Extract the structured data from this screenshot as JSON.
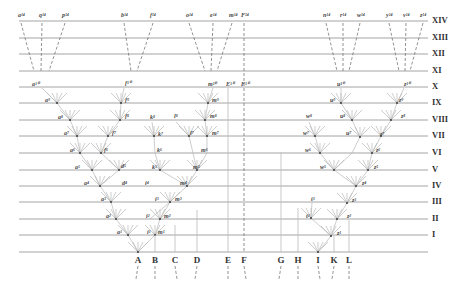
{
  "diagram": {
    "title": "",
    "levels": [
      {
        "label": "XIV",
        "y": 21
      },
      {
        "label": "XIII",
        "y": 38
      },
      {
        "label": "XII",
        "y": 54
      },
      {
        "label": "XI",
        "y": 71
      },
      {
        "label": "X",
        "y": 87
      },
      {
        "label": "IX",
        "y": 103
      },
      {
        "label": "VIII",
        "y": 120
      },
      {
        "label": "VII",
        "y": 136
      },
      {
        "label": "VI",
        "y": 153
      },
      {
        "label": "V",
        "y": 170
      },
      {
        "label": "IV",
        "y": 186
      },
      {
        "label": "III",
        "y": 202
      },
      {
        "label": "II",
        "y": 219
      },
      {
        "label": "I",
        "y": 235
      }
    ],
    "base_y": 252,
    "species": [
      {
        "label": "A",
        "x": 138
      },
      {
        "label": "B",
        "x": 155
      },
      {
        "label": "C",
        "x": 175
      },
      {
        "label": "D",
        "x": 197
      },
      {
        "label": "E",
        "x": 228
      },
      {
        "label": "F",
        "x": 244
      },
      {
        "label": "G",
        "x": 281
      },
      {
        "label": "H",
        "x": 298
      },
      {
        "label": "I",
        "x": 318
      },
      {
        "label": "K",
        "x": 334
      },
      {
        "label": "L",
        "x": 349
      }
    ],
    "top_descendants": [
      {
        "label": "a¹⁴",
        "x": 21
      },
      {
        "label": "q¹⁴",
        "x": 42
      },
      {
        "label": "p¹⁴",
        "x": 65
      },
      {
        "label": "b¹⁴",
        "x": 124
      },
      {
        "label": "f¹⁴",
        "x": 153
      },
      {
        "label": "o¹⁴",
        "x": 189
      },
      {
        "label": "e¹⁴",
        "x": 213
      },
      {
        "label": "m¹⁴",
        "x": 232
      },
      {
        "label": "F¹⁴",
        "x": 244
      },
      {
        "label": "n¹⁴",
        "x": 326
      },
      {
        "label": "r¹⁴",
        "x": 343
      },
      {
        "label": "w¹⁴",
        "x": 360
      },
      {
        "label": "y¹⁴",
        "x": 389
      },
      {
        "label": "v¹⁴",
        "x": 406
      },
      {
        "label": "z¹⁴",
        "x": 423
      }
    ],
    "node_labels": [
      {
        "label": "a¹⁰",
        "x": 32,
        "y": 80
      },
      {
        "label": "a⁹",
        "x": 45,
        "y": 97
      },
      {
        "label": "a⁸",
        "x": 58,
        "y": 114
      },
      {
        "label": "a⁷",
        "x": 64,
        "y": 130
      },
      {
        "label": "a⁶",
        "x": 70,
        "y": 147
      },
      {
        "label": "a⁵",
        "x": 75,
        "y": 164
      },
      {
        "label": "a⁴",
        "x": 84,
        "y": 180
      },
      {
        "label": "a³",
        "x": 101,
        "y": 196
      },
      {
        "label": "a²",
        "x": 106,
        "y": 213
      },
      {
        "label": "a¹",
        "x": 117,
        "y": 229
      },
      {
        "label": "f¹⁰",
        "x": 125,
        "y": 79
      },
      {
        "label": "f⁹",
        "x": 125,
        "y": 97
      },
      {
        "label": "f⁸",
        "x": 125,
        "y": 113
      },
      {
        "label": "f⁷",
        "x": 112,
        "y": 130
      },
      {
        "label": "f⁶",
        "x": 104,
        "y": 147
      },
      {
        "label": "d⁵",
        "x": 121,
        "y": 163
      },
      {
        "label": "d⁴",
        "x": 122,
        "y": 180
      },
      {
        "label": "m¹⁰",
        "x": 208,
        "y": 80
      },
      {
        "label": "m⁹",
        "x": 212,
        "y": 97
      },
      {
        "label": "m⁸",
        "x": 210,
        "y": 113
      },
      {
        "label": "m⁷",
        "x": 212,
        "y": 130
      },
      {
        "label": "m⁶",
        "x": 201,
        "y": 147
      },
      {
        "label": "m⁵",
        "x": 193,
        "y": 164
      },
      {
        "label": "m⁴",
        "x": 180,
        "y": 180
      },
      {
        "label": "m³",
        "x": 175,
        "y": 196
      },
      {
        "label": "m²",
        "x": 164,
        "y": 213
      },
      {
        "label": "m¹",
        "x": 158,
        "y": 229
      },
      {
        "label": "k⁸",
        "x": 150,
        "y": 114
      },
      {
        "label": "k⁷",
        "x": 158,
        "y": 131
      },
      {
        "label": "k⁶",
        "x": 157,
        "y": 147
      },
      {
        "label": "k⁵",
        "x": 152,
        "y": 164
      },
      {
        "label": "l⁸",
        "x": 174,
        "y": 113
      },
      {
        "label": "l⁷",
        "x": 190,
        "y": 130
      },
      {
        "label": "i⁴",
        "x": 145,
        "y": 180
      },
      {
        "label": "i³",
        "x": 155,
        "y": 196
      },
      {
        "label": "i²",
        "x": 146,
        "y": 213
      },
      {
        "label": "i¹",
        "x": 147,
        "y": 229
      },
      {
        "label": "E¹⁰",
        "x": 226,
        "y": 80
      },
      {
        "label": "F¹⁰",
        "x": 241,
        "y": 80
      },
      {
        "label": "u¹⁰",
        "x": 337,
        "y": 80
      },
      {
        "label": "u⁹",
        "x": 330,
        "y": 97
      },
      {
        "label": "u⁸",
        "x": 340,
        "y": 113
      },
      {
        "label": "u⁷",
        "x": 346,
        "y": 130
      },
      {
        "label": "w⁸",
        "x": 306,
        "y": 113
      },
      {
        "label": "w⁷",
        "x": 303,
        "y": 130
      },
      {
        "label": "w⁶",
        "x": 305,
        "y": 147
      },
      {
        "label": "w⁵",
        "x": 320,
        "y": 164
      },
      {
        "label": "z¹⁰",
        "x": 404,
        "y": 80
      },
      {
        "label": "z⁹",
        "x": 399,
        "y": 97
      },
      {
        "label": "z⁸",
        "x": 401,
        "y": 113
      },
      {
        "label": "z⁷",
        "x": 380,
        "y": 131
      },
      {
        "label": "z⁶",
        "x": 376,
        "y": 147
      },
      {
        "label": "z⁵",
        "x": 374,
        "y": 164
      },
      {
        "label": "z⁴",
        "x": 362,
        "y": 180
      },
      {
        "label": "z³",
        "x": 352,
        "y": 197
      },
      {
        "label": "z²",
        "x": 347,
        "y": 213
      },
      {
        "label": "z¹",
        "x": 337,
        "y": 230
      },
      {
        "label": "t³",
        "x": 311,
        "y": 196
      },
      {
        "label": "t²",
        "x": 306,
        "y": 213
      }
    ]
  }
}
